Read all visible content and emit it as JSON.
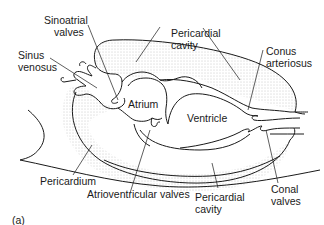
{
  "figure": {
    "panel_label": "(a)",
    "labels": {
      "sinoatrial_valves": [
        "Sinoatrial",
        "valves"
      ],
      "sinus_venosus": [
        "Sinus",
        "venosus"
      ],
      "pericardial_cavity_top": [
        "Pericardial",
        "cavity"
      ],
      "conus_arteriosus": [
        "Conus",
        "arteriosus"
      ],
      "atrium": "Atrium",
      "ventricle": "Ventricle",
      "pericardium": "Pericardium",
      "atrioventricular_valves": "Atrioventricular valves",
      "pericardial_cavity_bottom": [
        "Pericardial",
        "cavity"
      ],
      "conal_valves": [
        "Conal",
        "valves"
      ]
    },
    "colors": {
      "line": "#1a1a1a",
      "stipple": "#c8c8c8",
      "background": "#ffffff"
    }
  }
}
